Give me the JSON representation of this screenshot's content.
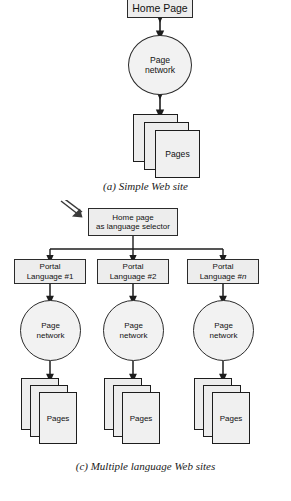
{
  "figure": {
    "background": "#ffffff",
    "node_fill": "#ededed",
    "node_stroke": "#2b2b2b",
    "line_color": "#222222"
  },
  "diagram_a": {
    "caption": "(a) Simple Web site",
    "home_page": {
      "label": "Home Page"
    },
    "page_network": {
      "label": "Page\nnetwork"
    },
    "pages": {
      "label": "Pages",
      "sheet_count": 3
    },
    "connectors": [
      {
        "from": "home-page",
        "to": "page-network",
        "style": "double-arrow"
      },
      {
        "from": "page-network",
        "to": "pages",
        "style": "double-arrow"
      }
    ]
  },
  "diagram_c": {
    "caption": "(c) Multiple language Web sites",
    "pointer": {
      "name": "diagonal-arrow-pointer"
    },
    "home_page": {
      "line1": "Home page",
      "line2": "as language selector"
    },
    "portals": [
      {
        "line1": "Portal",
        "line2_prefix": "Language #",
        "index": "1"
      },
      {
        "line1": "Portal",
        "line2_prefix": "Language #",
        "index": "2"
      },
      {
        "line1": "Portal",
        "line2_prefix": "Language #",
        "index": "n"
      }
    ],
    "networks": [
      {
        "label": "Page\nnetwork"
      },
      {
        "label": "Page\nnetwork"
      },
      {
        "label": "Page\nnetwork"
      }
    ],
    "pages": [
      {
        "label": "Pages",
        "sheet_count": 3
      },
      {
        "label": "Pages",
        "sheet_count": 3
      },
      {
        "label": "Pages",
        "sheet_count": 3
      }
    ]
  }
}
